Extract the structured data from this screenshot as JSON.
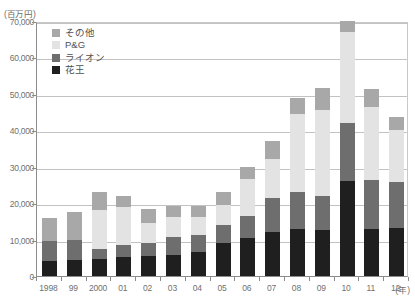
{
  "unit_label": "(百万円)",
  "xaxis_unit": "(年)",
  "legend": {
    "items": [
      {
        "label": "その他",
        "color": "#a8a8a8"
      },
      {
        "label": "P&G",
        "color": "#e3e3e3"
      },
      {
        "label": "ライオン",
        "color": "#6e6e6e"
      },
      {
        "label": "花王",
        "color": "#1f1f1f"
      }
    ]
  },
  "chart_data": {
    "type": "bar",
    "stacked": true,
    "title": "",
    "subtitle": "",
    "xlabel": "(年)",
    "ylabel": "(百万円)",
    "ylim": [
      0,
      70000
    ],
    "ytick_step": 10000,
    "grid": true,
    "legend_position": "top-left",
    "categories": [
      "1998",
      "99",
      "2000",
      "01",
      "02",
      "03",
      "04",
      "05",
      "06",
      "07",
      "08",
      "09",
      "10",
      "11",
      "12"
    ],
    "ytick_labels": [
      "0",
      "10,000",
      "20,000",
      "30,000",
      "40,000",
      "50,000",
      "60,000",
      "70,000"
    ],
    "series": [
      {
        "name": "花王",
        "color": "#1f1f1f",
        "values": [
          4000,
          4500,
          4800,
          5300,
          5500,
          5800,
          6500,
          9000,
          10500,
          12000,
          13000,
          12500,
          26000,
          12800,
          13200
        ]
      },
      {
        "name": "ライオン",
        "color": "#6e6e6e",
        "values": [
          5500,
          5500,
          2700,
          3200,
          3500,
          5000,
          4800,
          5000,
          6000,
          9500,
          10000,
          9500,
          16000,
          13500,
          12500
        ]
      },
      {
        "name": "P&G",
        "color": "#e3e3e3",
        "values": [
          0,
          0,
          10500,
          10500,
          5500,
          5300,
          5000,
          5500,
          10000,
          10500,
          21500,
          23500,
          25000,
          20000,
          14500
        ]
      },
      {
        "name": "その他",
        "color": "#a8a8a8",
        "values": [
          6500,
          7500,
          5000,
          3000,
          4000,
          3000,
          3000,
          3500,
          3500,
          5000,
          4500,
          6000,
          3000,
          5000,
          3500
        ]
      }
    ],
    "totals": [
      16000,
      17500,
      23000,
      22000,
      18500,
      19100,
      19300,
      23000,
      30000,
      37000,
      49000,
      51500,
      70000,
      51300,
      43700
    ]
  }
}
